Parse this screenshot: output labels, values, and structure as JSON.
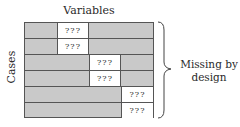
{
  "diagram": {
    "column_label": "Variables",
    "row_label": "Cases",
    "annotation": "Missing by design",
    "annotation_lines": [
      "Missing by",
      "design"
    ],
    "missing_marker": "???",
    "colors": {
      "observed": "#c9c9c9",
      "missing": "#ffffff",
      "lines": "#555555"
    },
    "rows": [
      {
        "missing_column": 1,
        "marker": "???"
      },
      {
        "missing_column": 1,
        "marker": "???"
      },
      {
        "missing_column": 2,
        "marker": "???"
      },
      {
        "missing_column": 2,
        "marker": "???"
      },
      {
        "missing_column": 3,
        "marker": "???"
      },
      {
        "missing_column": 3,
        "marker": "???"
      }
    ]
  }
}
